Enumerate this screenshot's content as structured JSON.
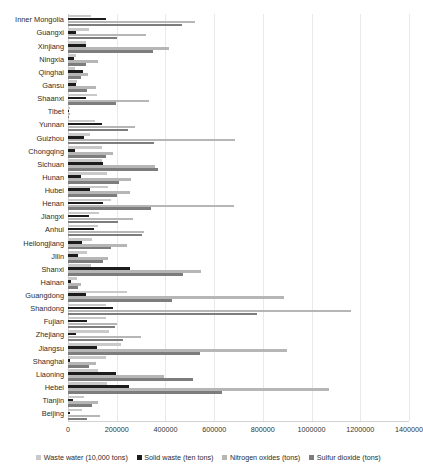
{
  "chart_data": {
    "type": "bar",
    "orientation": "horizontal",
    "title": "",
    "xlabel": "",
    "ylabel": "",
    "xlim": [
      0,
      1400000
    ],
    "xticks": [
      0,
      200000,
      400000,
      600000,
      800000,
      1000000,
      1200000,
      1400000
    ],
    "xtick_labels": [
      "0",
      "200000",
      "400000",
      "600000",
      "800000",
      "1000000",
      "1200000",
      "1400000"
    ],
    "grid": true,
    "legend_position": "bottom",
    "categories": [
      "Inner Mongolia",
      "Guangxi",
      "Xinjiang",
      "Ningxia",
      "Qinghai",
      "Gansu",
      "Shaanxi",
      "Tibet",
      "Yunnan",
      "Guizhou",
      "Chongqing",
      "Sichuan",
      "Hunan",
      "Hubei",
      "Henan",
      "Jiangxi",
      "Anhui",
      "Heilongjiang",
      "Jilin",
      "Shanxi",
      "Hainan",
      "Guangdong",
      "Shandong",
      "Fujian",
      "Zhejiang",
      "Jiangsu",
      "Shanghai",
      "Liaoning",
      "Hebei",
      "Tianjin",
      "Beijing"
    ],
    "series": [
      {
        "name": "Waste water (10,000 tons)",
        "color": "#c9c9c9",
        "values": [
          96000,
          86000,
          73000,
          34000,
          30000,
          35000,
          120000,
          7000,
          110000,
          92000,
          139000,
          139000,
          161000,
          166000,
          175000,
          126000,
          123000,
          100000,
          80000,
          94000,
          36000,
          243000,
          155000,
          158000,
          168000,
          216000,
          155000,
          125000,
          162000,
          66000,
          56000
        ]
      },
      {
        "name": "Solid waste (ten tons)",
        "color": "#1c1c1c",
        "values": [
          155000,
          31000,
          75000,
          24000,
          60000,
          32000,
          72000,
          2000,
          138000,
          66000,
          28000,
          144000,
          54000,
          92000,
          142000,
          88000,
          107000,
          56000,
          42000,
          255000,
          12000,
          72000,
          186000,
          80000,
          32000,
          121000,
          10000,
          196000,
          250000,
          20000,
          9000
        ]
      },
      {
        "name": "Nitrogen oxides (tons)",
        "color": "#b6b6b6",
        "values": [
          521000,
          320000,
          413000,
          124000,
          83000,
          113000,
          332000,
          8000,
          277000,
          685000,
          186000,
          358000,
          258000,
          255000,
          681000,
          265000,
          314000,
          243000,
          164000,
          548000,
          54000,
          885000,
          1160000,
          202000,
          298000,
          900000,
          114000,
          396000,
          1070000,
          122000,
          133000
        ]
      },
      {
        "name": "Sulfur dioxide (tons)",
        "color": "#7d7d7d",
        "values": [
          470000,
          200000,
          350000,
          75000,
          55000,
          80000,
          196000,
          6000,
          245000,
          355000,
          154000,
          370000,
          208000,
          200000,
          340000,
          205000,
          305000,
          175000,
          145000,
          472000,
          40000,
          425000,
          777000,
          192000,
          225000,
          541000,
          86000,
          515000,
          633000,
          98000,
          80000
        ]
      }
    ]
  }
}
